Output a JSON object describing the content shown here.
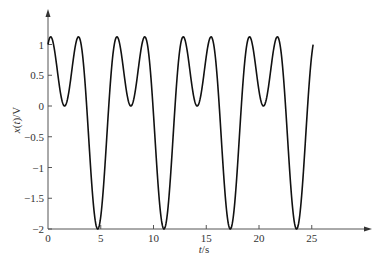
{
  "chart_data": {
    "type": "line",
    "title": "",
    "xlabel": "t/s",
    "ylabel": "x(t)/V",
    "xlim": [
      0,
      30
    ],
    "ylim": [
      -2,
      1.25
    ],
    "x_ticks": [
      0,
      5,
      10,
      15,
      20,
      25
    ],
    "x_tick_labels": [
      "0",
      "5",
      "10",
      "15",
      "20",
      "25"
    ],
    "y_ticks": [
      1,
      0.5,
      0,
      -0.5,
      -1,
      -1.5,
      -2
    ],
    "y_tick_labels": [
      "1",
      "0.5",
      "0",
      "−0.5",
      "−1",
      "−1.5",
      "−2"
    ],
    "grid": false,
    "legend": null,
    "series": [
      {
        "name": "x(t)",
        "expression": "sin(t) + cos(2t)",
        "t_range": [
          0,
          25.13
        ],
        "color": "#111111",
        "key_points": [
          {
            "t": 0,
            "x": 1.0
          },
          {
            "t": 0.25,
            "x": 1.125
          },
          {
            "t": 1.57,
            "x": 0.0
          },
          {
            "t": 2.89,
            "x": 1.125
          },
          {
            "t": 4.71,
            "x": -2.0
          },
          {
            "t": 6.53,
            "x": 1.125
          },
          {
            "t": 7.85,
            "x": 0.0
          },
          {
            "t": 9.17,
            "x": 1.125
          },
          {
            "t": 11.0,
            "x": -2.0
          },
          {
            "t": 12.82,
            "x": 1.125
          },
          {
            "t": 14.14,
            "x": 0.0
          },
          {
            "t": 15.46,
            "x": 1.125
          },
          {
            "t": 17.28,
            "x": -2.0
          },
          {
            "t": 19.1,
            "x": 1.125
          },
          {
            "t": 20.42,
            "x": 0.0
          },
          {
            "t": 21.74,
            "x": 1.125
          },
          {
            "t": 23.56,
            "x": -2.0
          },
          {
            "t": 25.13,
            "x": 1.0
          }
        ]
      }
    ]
  },
  "axes": {
    "x_label": "t/s",
    "y_label": "x(t)/V"
  }
}
